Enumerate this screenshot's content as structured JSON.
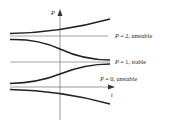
{
  "diagram": {
    "axes": {
      "y_label": "P",
      "x_label": "t"
    },
    "equilibria": [
      {
        "label": "P = 2, unstable",
        "var": "P",
        "rest": " = 2, unstable",
        "value": 2,
        "stability": "unstable"
      },
      {
        "label": "P = 1, stable",
        "var": "P",
        "rest": " = 1, stable",
        "value": 1,
        "stability": "stable"
      },
      {
        "label": "P = 0, unstable",
        "var": "P",
        "rest": " = 0, unstable",
        "value": 0,
        "stability": "unstable"
      }
    ],
    "solution_curves": [
      {
        "description": "above P=2, diverges upward"
      },
      {
        "description": "between P=1 and P=2, decreases to P=1"
      },
      {
        "description": "between P=0 and P=1, increases to P=1"
      },
      {
        "description": "below P=0, diverges downward"
      }
    ]
  }
}
